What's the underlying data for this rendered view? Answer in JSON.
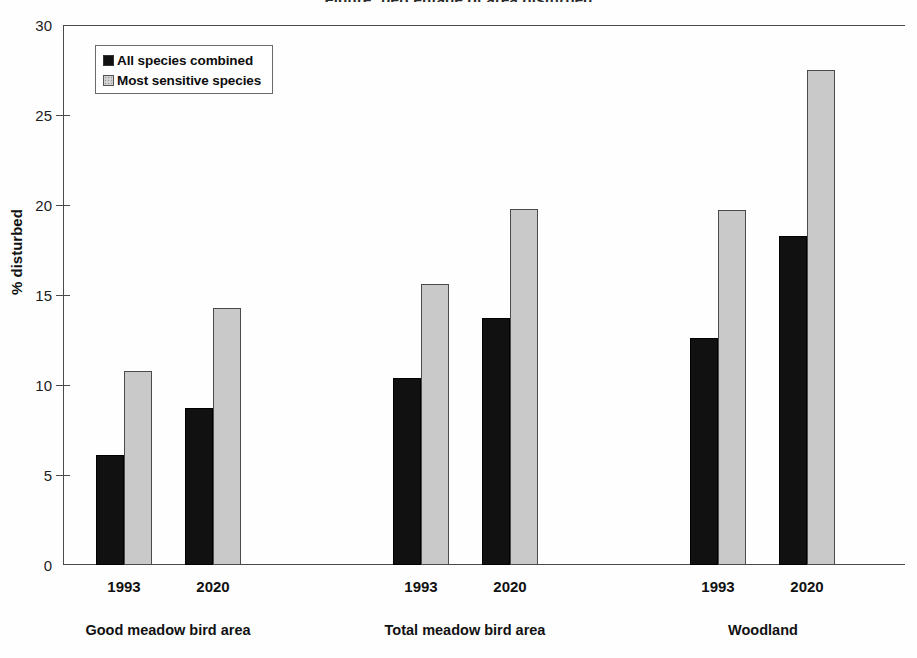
{
  "title_partial": "Figure: percentage of area disturbed",
  "legend": {
    "position": "top-left-inside",
    "items": [
      {
        "label": "All species combined",
        "color": "#111111",
        "swatch": "dark-square-icon"
      },
      {
        "label": "Most sensitive species",
        "color": "#c9c9c9",
        "swatch": "light-square-icon"
      }
    ]
  },
  "axis": {
    "ylabel": "% disturbed",
    "yticks": [
      "0",
      "5",
      "10",
      "15",
      "20",
      "25",
      "30"
    ],
    "ymin": 0,
    "ymax": 30
  },
  "groups": [
    {
      "name": "Good meadow bird area",
      "years": [
        "1993",
        "2020"
      ]
    },
    {
      "name": "Total meadow bird area",
      "years": [
        "1993",
        "2020"
      ]
    },
    {
      "name": "Woodland",
      "years": [
        "1993",
        "2020"
      ]
    }
  ],
  "chart_data": {
    "type": "bar",
    "title": "",
    "xlabel": "",
    "ylabel": "% disturbed",
    "ylim": [
      0,
      30
    ],
    "ytick_values": [
      0,
      5,
      10,
      15,
      20,
      25,
      30
    ],
    "grid": false,
    "legend_position": "upper left (inside plot)",
    "categories": [
      "Good meadow bird area 1993",
      "Good meadow bird area 2020",
      "Total meadow bird area 1993",
      "Total meadow bird area 2020",
      "Woodland 1993",
      "Woodland 2020"
    ],
    "group_labels": [
      "Good meadow bird area",
      "Total meadow bird area",
      "Woodland"
    ],
    "year_labels": [
      "1993",
      "2020",
      "1993",
      "2020",
      "1993",
      "2020"
    ],
    "series": [
      {
        "name": "All species combined",
        "color": "#111111",
        "values": [
          6.1,
          8.7,
          10.4,
          13.7,
          12.6,
          18.3
        ]
      },
      {
        "name": "Most sensitive species",
        "color": "#c9c9c9",
        "values": [
          10.8,
          14.3,
          15.6,
          19.8,
          19.7,
          27.5
        ]
      }
    ]
  },
  "bars": [
    {
      "name": "good-1993-all",
      "series": 0,
      "value": 6.1,
      "left": 33,
      "width": 28
    },
    {
      "name": "good-1993-sensitive",
      "series": 1,
      "value": 10.8,
      "left": 61,
      "width": 28
    },
    {
      "name": "good-2020-all",
      "series": 0,
      "value": 8.7,
      "left": 122,
      "width": 28
    },
    {
      "name": "good-2020-sensitive",
      "series": 1,
      "value": 14.3,
      "left": 150,
      "width": 28
    },
    {
      "name": "total-1993-all",
      "series": 0,
      "value": 10.4,
      "left": 330,
      "width": 28
    },
    {
      "name": "total-1993-sensitive",
      "series": 1,
      "value": 15.6,
      "left": 358,
      "width": 28
    },
    {
      "name": "total-2020-all",
      "series": 0,
      "value": 13.7,
      "left": 419,
      "width": 28
    },
    {
      "name": "total-2020-sensitive",
      "series": 1,
      "value": 19.8,
      "left": 447,
      "width": 28
    },
    {
      "name": "wood-1993-all",
      "series": 0,
      "value": 12.6,
      "left": 627,
      "width": 28
    },
    {
      "name": "wood-1993-sensitive",
      "series": 1,
      "value": 19.7,
      "left": 655,
      "width": 28
    },
    {
      "name": "wood-2020-all",
      "series": 0,
      "value": 18.3,
      "left": 716,
      "width": 28
    },
    {
      "name": "wood-2020-sensitive",
      "series": 1,
      "value": 27.5,
      "left": 744,
      "width": 28
    }
  ],
  "xlabels": [
    {
      "text": "1993",
      "left": 61
    },
    {
      "text": "2020",
      "left": 150
    },
    {
      "text": "1993",
      "left": 358
    },
    {
      "text": "2020",
      "left": 447
    },
    {
      "text": "1993",
      "left": 655
    },
    {
      "text": "2020",
      "left": 744
    }
  ],
  "grouplabels": [
    {
      "text": "Good meadow bird area",
      "left": 105
    },
    {
      "text": "Total meadow bird area",
      "left": 402
    },
    {
      "text": "Woodland",
      "left": 700
    }
  ]
}
